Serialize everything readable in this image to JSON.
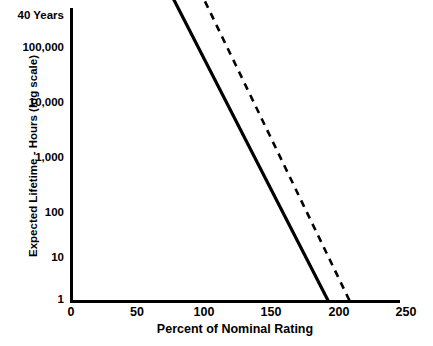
{
  "chart_data": {
    "type": "line",
    "title": "",
    "xlabel": "Percent of Nominal Rating",
    "ylabel": "Expected Lifetime - Hours (log scale)",
    "xlim": [
      0,
      250
    ],
    "ylim": [
      1,
      1000000
    ],
    "yscale": "log",
    "grid": false,
    "legend": null,
    "xticks": [
      {
        "label": "0",
        "value": 0
      },
      {
        "label": "50",
        "value": 50
      },
      {
        "label": "100",
        "value": 100
      },
      {
        "label": "150",
        "value": 150
      },
      {
        "label": "200",
        "value": 200
      },
      {
        "label": "250",
        "value": 250
      }
    ],
    "yticks": [
      {
        "label": "40 Years",
        "value": 350000
      },
      {
        "label": "100,000",
        "value": 100000
      },
      {
        "label": "10,000",
        "value": 10000
      },
      {
        "label": "1,000",
        "value": 1000
      },
      {
        "label": "100",
        "value": 100
      },
      {
        "label": "10",
        "value": 10
      },
      {
        "label": "1",
        "value": 1
      }
    ],
    "series": [
      {
        "name": "solid-line",
        "style": "solid",
        "color": "#000000",
        "width": 3.2,
        "points": [
          {
            "x": 76,
            "y": 350000
          },
          {
            "x": 192,
            "y": 1
          }
        ]
      },
      {
        "name": "dashed-line",
        "style": "dashed",
        "color": "#000000",
        "width": 2.6,
        "dash": "7 6",
        "points": [
          {
            "x": 100,
            "y": 300000
          },
          {
            "x": 208,
            "y": 1
          }
        ]
      }
    ]
  }
}
